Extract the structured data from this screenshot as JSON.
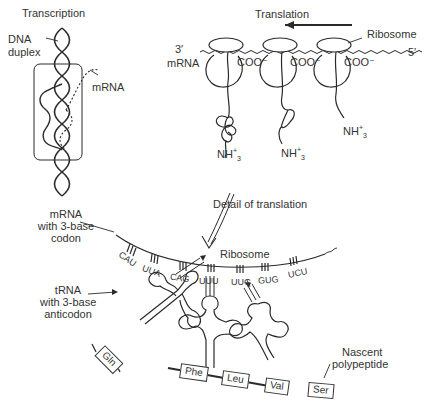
{
  "transcription": {
    "title": "Transcription",
    "dna_label_line1": "DNA",
    "dna_label_line2": "duplex",
    "mrna_label": "mRNA"
  },
  "translation": {
    "title": "Translation",
    "ribosome_label": "Ribosome",
    "mrna_label": "mRNA",
    "end_3prime": "3′",
    "end_5prime": "5′",
    "carboxyl": "COO⁻",
    "amino_base": "NH",
    "amino_sup": "+",
    "amino_sub": "3",
    "ribosome_count": 3
  },
  "detail": {
    "arrow_label": "Detail of translation",
    "mrna_label_line1": "mRNA",
    "mrna_label_line2": "with 3-base",
    "mrna_label_line3": "codon",
    "ribosome_label": "Ribosome",
    "trna_label_line1": "tRNA",
    "trna_label_line2": "with 3-base",
    "trna_label_line3": "anticodon",
    "codons": [
      "CAU",
      "UUA",
      "CAG",
      "UUU",
      "UUG",
      "GUG",
      "UCU"
    ],
    "amino_acids": [
      "Gln",
      "Phe",
      "Leu",
      "Val",
      "Ser"
    ],
    "polypeptide_label_line1": "Nascent",
    "polypeptide_label_line2": "polypeptide"
  }
}
